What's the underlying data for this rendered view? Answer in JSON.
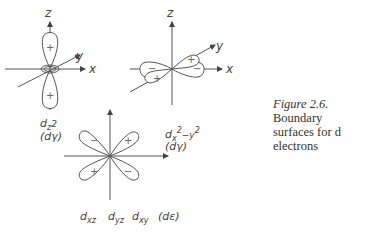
{
  "figure": {
    "caption_label": "Figure 2.6.",
    "caption_text_line1": "Boundary",
    "caption_text_line2": "surfaces for d electrons",
    "caption_italic_word": "d"
  },
  "panels": {
    "dz2": {
      "orbital_label": "dz2",
      "subscript": "z",
      "sup": "2",
      "group": "(dγ)",
      "axes": [
        "z",
        "y",
        "x"
      ],
      "lobe_signs": [
        "+",
        "+"
      ]
    },
    "dx2y2": {
      "orbital_label": "dx2−y2",
      "subscript": "x",
      "sup1": "2",
      "mid": "−y",
      "sup2": "2",
      "group": "(dγ)",
      "axes": [
        "z",
        "y",
        "x"
      ],
      "lobe_signs": [
        "−",
        "+",
        "−",
        "+"
      ]
    },
    "dxz": {
      "labels": [
        "dxz",
        "dyz",
        "dxy"
      ],
      "sub": [
        "xz",
        "yz",
        "xy"
      ],
      "group": "(dε)",
      "lobe_signs": [
        "−",
        "+",
        "+",
        "−"
      ]
    }
  }
}
